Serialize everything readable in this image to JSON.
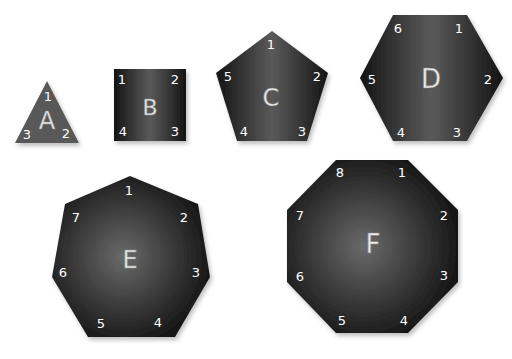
{
  "shapes": [
    {
      "id": "A",
      "name": "triangle",
      "sides": 3,
      "letter": "A",
      "vertex_labels": [
        "1",
        "2",
        "3"
      ]
    },
    {
      "id": "B",
      "name": "square",
      "sides": 4,
      "letter": "B",
      "vertex_labels": [
        "1",
        "2",
        "3",
        "4"
      ]
    },
    {
      "id": "C",
      "name": "pentagon",
      "sides": 5,
      "letter": "C",
      "vertex_labels": [
        "1",
        "2",
        "3",
        "4",
        "5"
      ]
    },
    {
      "id": "D",
      "name": "hexagon",
      "sides": 6,
      "letter": "D",
      "vertex_labels": [
        "1",
        "2",
        "3",
        "4",
        "5",
        "6"
      ]
    },
    {
      "id": "E",
      "name": "heptagon",
      "sides": 7,
      "letter": "E",
      "vertex_labels": [
        "1",
        "2",
        "3",
        "4",
        "5",
        "6",
        "7"
      ]
    },
    {
      "id": "F",
      "name": "octagon",
      "sides": 8,
      "letter": "F",
      "vertex_labels": [
        "1",
        "2",
        "3",
        "4",
        "5",
        "6",
        "7",
        "8"
      ]
    }
  ],
  "colors": {
    "triangle_fill": "#5a5a5a",
    "shape_dark": "#111111",
    "shape_light": "#5c5c5c",
    "label": "#ffffff"
  }
}
